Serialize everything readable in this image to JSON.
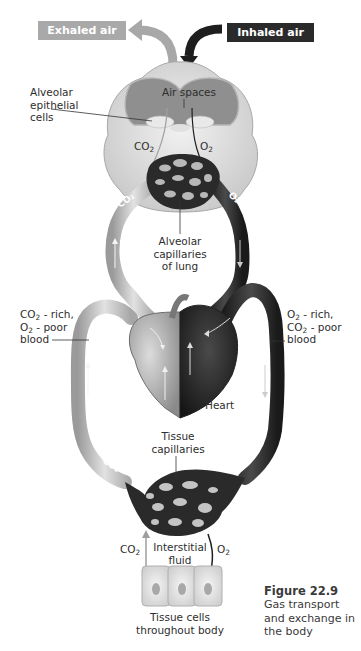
{
  "figure": {
    "number": "Figure 22.9",
    "caption_lines": [
      "Gas transport",
      "and exchange in",
      "the body"
    ]
  },
  "top_labels": {
    "exhaled": "Exhaled air",
    "inhaled": "Inhaled air"
  },
  "lung": {
    "air_spaces": "Air spaces",
    "alveolar_epithelial": [
      "Alveolar",
      "epithelial",
      "cells"
    ],
    "co2_label": "CO",
    "co2_sub": "2",
    "o2_label": "O",
    "o2_sub": "2",
    "capillaries": [
      "Alveolar",
      "capillaries",
      "of lung"
    ]
  },
  "vessels": {
    "left_label": {
      "line1_gas": "CO",
      "line1_sub": "2",
      "line1_rest": " - rich,",
      "line2_gas": "O",
      "line2_sub": "2",
      "line2_rest": " - poor",
      "line3": "blood"
    },
    "right_label": {
      "line1_gas": "O",
      "line1_sub": "2",
      "line1_rest": " - rich,",
      "line2_gas": "CO",
      "line2_sub": "2",
      "line2_rest": " - poor",
      "line3": "blood"
    },
    "pulmonary_co2": "CO2",
    "pulmonary_o2": "O2",
    "systemic_co2": "CO2",
    "systemic_o2": "O2"
  },
  "heart": {
    "label": "Heart"
  },
  "tissue": {
    "capillaries": [
      "Tissue",
      "capillaries"
    ],
    "interstitial": [
      "Interstitial",
      "fluid"
    ],
    "co2_label": "CO",
    "co2_sub": "2",
    "o2_label": "O",
    "o2_sub": "2",
    "cells": [
      "Tissue cells",
      "throughout body"
    ]
  },
  "colors": {
    "deoxygenated": "#c8c8c8",
    "oxygenated": "#2e2e2e",
    "exhaled_box": "#a9a9a9",
    "inhaled_box": "#2a2a2a"
  }
}
